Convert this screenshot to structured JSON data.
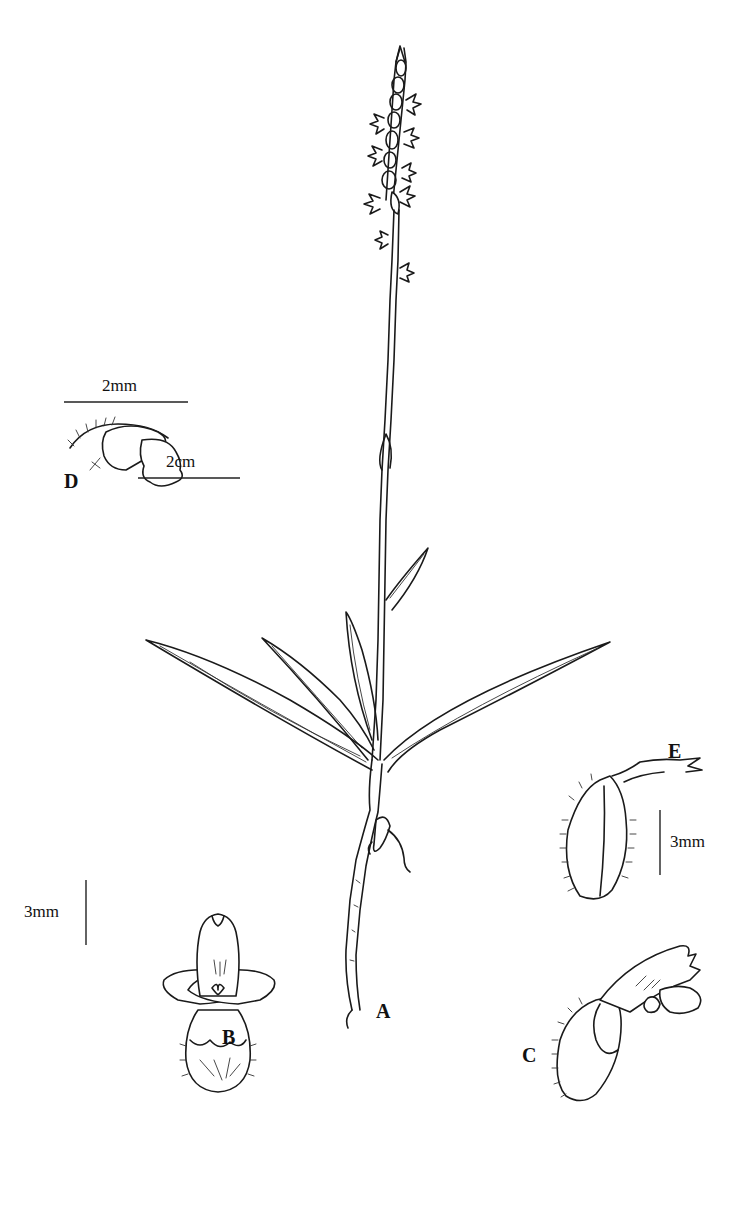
{
  "figure": {
    "type": "botanical-line-illustration",
    "background": "#ffffff",
    "ink_color": "#1a1a1a"
  },
  "panels": {
    "A": {
      "label": "A",
      "desc": "whole plant habit"
    },
    "B": {
      "label": "B",
      "desc": "flower, front view"
    },
    "C": {
      "label": "C",
      "desc": "flower, side view"
    },
    "D": {
      "label": "D",
      "desc": "lip / column detail"
    },
    "E": {
      "label": "E",
      "desc": "ovary with sepal, side view"
    }
  },
  "scale_bars": {
    "habit": {
      "label": "2cm"
    },
    "detail_d": {
      "label": "2mm"
    },
    "detail_b": {
      "label": "3mm"
    },
    "detail_e": {
      "label": "3mm"
    }
  }
}
